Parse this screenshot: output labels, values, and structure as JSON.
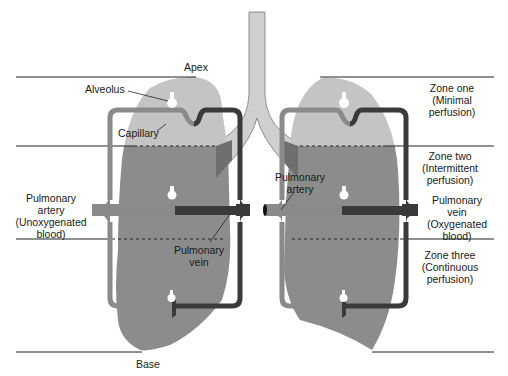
{
  "diagram": {
    "labels": {
      "apex": "Apex",
      "base": "Base",
      "alveolus": "Alveolus",
      "capillary": "Capillary",
      "left_artery": [
        "Pulmonary",
        "artery",
        "(Unoxygenated",
        "blood)"
      ],
      "left_vein": [
        "Pulmonary",
        "vein"
      ],
      "right_artery": [
        "Pulmonary",
        "artery"
      ],
      "right_vein": [
        "Pulmonary",
        "vein",
        "(Oxygenated",
        "blood)"
      ],
      "zone_one": [
        "Zone one",
        "(Minimal",
        "perfusion)"
      ],
      "zone_two": [
        "Zone two",
        "(Intermittent",
        "perfusion)"
      ],
      "zone_three": [
        "Zone three",
        "(Continuous",
        "perfusion)"
      ]
    },
    "colors": {
      "lung_upper": "#c4c4c4",
      "lung_lower": "#8c8c8c",
      "artery": "#8a8a8a",
      "vein": "#3a3a3a",
      "trachea": "#d0d0d0",
      "line": "#222222"
    }
  }
}
